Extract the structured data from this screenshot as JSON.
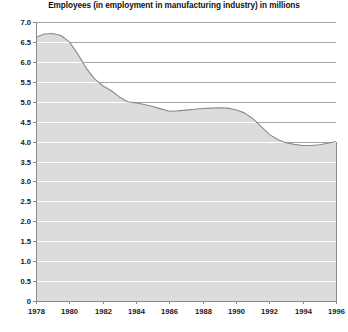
{
  "chart_title": "Employees (in employment in manufacturing industry) in millions",
  "colors": {
    "area_fill": "#dcdcdc",
    "area_line": "#8a8a8a",
    "gridline": "#ffffff",
    "axis": "#8a8a8a",
    "text": "#111111",
    "background": "#ffffff"
  },
  "chart_data": {
    "type": "area",
    "title": "Employees (in employment in manufacturing industry) in millions",
    "xlabel": "",
    "ylabel": "",
    "xlim": [
      1978,
      1996
    ],
    "ylim": [
      0,
      7.0
    ],
    "grid": true,
    "legend": null,
    "ytick_labels": [
      "7.0",
      "6.5",
      "6.0",
      "5.5",
      "5.0",
      "4.5",
      "4.0",
      "3.5",
      "3.0",
      "2.5",
      "2.0",
      "1.5",
      "1.0",
      "0.5",
      "0"
    ],
    "ytick_values": [
      7.0,
      6.5,
      6.0,
      5.5,
      5.0,
      4.5,
      4.0,
      3.5,
      3.0,
      2.5,
      2.0,
      1.5,
      1.0,
      0.5,
      0
    ],
    "xtick_labels": [
      "1978",
      "1980",
      "1982",
      "1984",
      "1986",
      "1988",
      "1990",
      "1992",
      "1994",
      "1996"
    ],
    "xtick_values": [
      1978,
      1980,
      1982,
      1984,
      1986,
      1988,
      1990,
      1992,
      1994,
      1996
    ],
    "series": [
      {
        "name": "Employees in manufacturing industry (millions)",
        "x": [
          1978,
          1978.5,
          1979,
          1979.5,
          1980,
          1980.5,
          1981,
          1981.5,
          1982,
          1982.5,
          1983,
          1983.5,
          1984,
          1984.5,
          1985,
          1985.5,
          1986,
          1986.5,
          1987,
          1987.5,
          1988,
          1988.5,
          1989,
          1989.5,
          1990,
          1990.5,
          1991,
          1991.5,
          1992,
          1992.5,
          1993,
          1993.5,
          1994,
          1994.5,
          1995,
          1995.5,
          1996
        ],
        "values": [
          6.62,
          6.7,
          6.71,
          6.66,
          6.5,
          6.2,
          5.85,
          5.58,
          5.4,
          5.28,
          5.12,
          5.0,
          4.97,
          4.93,
          4.88,
          4.82,
          4.76,
          4.77,
          4.79,
          4.81,
          4.83,
          4.84,
          4.85,
          4.84,
          4.8,
          4.72,
          4.58,
          4.38,
          4.18,
          4.05,
          3.97,
          3.93,
          3.9,
          3.9,
          3.92,
          3.96,
          4.0
        ]
      }
    ]
  },
  "plot_geometry": {
    "left": 36,
    "right": 336,
    "top": 22,
    "bottom": 301
  }
}
